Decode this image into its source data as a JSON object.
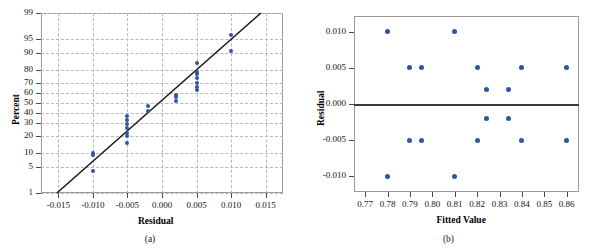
{
  "figure": {
    "panels": [
      {
        "caption": "(a)",
        "chart_data": {
          "type": "scatter",
          "title": "",
          "subtitle": "",
          "xlabel": "Residual",
          "ylabel": "Percent",
          "xlim": [
            -0.0175,
            0.0175
          ],
          "ylim": [
            1,
            99
          ],
          "yscale": "normal-probability",
          "grid": true,
          "legend": "none",
          "xticks": [
            "-0.015",
            "-0.010",
            "-0.005",
            "0.000",
            "0.005",
            "0.010",
            "0.015"
          ],
          "xtickvalues": [
            -0.015,
            -0.01,
            -0.005,
            0.0,
            0.005,
            0.01,
            0.015
          ],
          "yticks": [
            "1",
            "5",
            "10",
            "20",
            "30",
            "40",
            "50",
            "60",
            "70",
            "80",
            "90",
            "95",
            "99"
          ],
          "ytickvalues": [
            1,
            5,
            10,
            20,
            30,
            40,
            50,
            60,
            70,
            80,
            90,
            95,
            99
          ],
          "reference_line": {
            "label": "normal fit line",
            "x": [
              -0.0152,
              0.0143
            ],
            "y": [
              1,
              99
            ]
          },
          "points": [
            {
              "x": -0.01,
              "y": 4
            },
            {
              "x": -0.01,
              "y": 9
            },
            {
              "x": -0.01,
              "y": 10
            },
            {
              "x": -0.005,
              "y": 15
            },
            {
              "x": -0.005,
              "y": 20
            },
            {
              "x": -0.005,
              "y": 22
            },
            {
              "x": -0.005,
              "y": 26
            },
            {
              "x": -0.005,
              "y": 29
            },
            {
              "x": -0.005,
              "y": 33
            },
            {
              "x": -0.005,
              "y": 37
            },
            {
              "x": -0.002,
              "y": 42
            },
            {
              "x": -0.002,
              "y": 47
            },
            {
              "x": 0.002,
              "y": 52
            },
            {
              "x": 0.002,
              "y": 56
            },
            {
              "x": 0.002,
              "y": 58
            },
            {
              "x": 0.005,
              "y": 63
            },
            {
              "x": 0.005,
              "y": 66
            },
            {
              "x": 0.005,
              "y": 70
            },
            {
              "x": 0.005,
              "y": 74
            },
            {
              "x": 0.005,
              "y": 77
            },
            {
              "x": 0.005,
              "y": 79
            },
            {
              "x": 0.005,
              "y": 85
            },
            {
              "x": 0.01,
              "y": 91
            },
            {
              "x": 0.01,
              "y": 96
            }
          ],
          "marker_color": "#2f55a4"
        }
      },
      {
        "caption": "(b)",
        "chart_data": {
          "type": "scatter",
          "title": "",
          "subtitle": "",
          "xlabel": "Fitted Value",
          "ylabel": "Residual",
          "xlim": [
            0.765,
            0.8655
          ],
          "ylim": [
            -0.0122,
            0.0122
          ],
          "grid": false,
          "legend": "none",
          "xticks": [
            "0.77",
            "0.78",
            "0.79",
            "0.80",
            "0.81",
            "0.82",
            "0.83",
            "0.84",
            "0.85",
            "0.86"
          ],
          "xtickvalues": [
            0.77,
            0.78,
            0.79,
            0.8,
            0.81,
            0.82,
            0.83,
            0.84,
            0.85,
            0.86
          ],
          "yticks": [
            "0.010",
            "0.005",
            "0.000",
            "-0.005",
            "-0.010"
          ],
          "ytickvalues": [
            0.01,
            0.005,
            0.0,
            -0.005,
            -0.01
          ],
          "zero_line": {
            "label": "zero residual line",
            "y": 0.0
          },
          "points": [
            {
              "x": 0.78,
              "y": 0.01
            },
            {
              "x": 0.81,
              "y": 0.01
            },
            {
              "x": 0.79,
              "y": 0.005
            },
            {
              "x": 0.795,
              "y": 0.005
            },
            {
              "x": 0.82,
              "y": 0.005
            },
            {
              "x": 0.84,
              "y": 0.005
            },
            {
              "x": 0.86,
              "y": 0.005
            },
            {
              "x": 0.824,
              "y": 0.002
            },
            {
              "x": 0.834,
              "y": 0.002
            },
            {
              "x": 0.824,
              "y": -0.002
            },
            {
              "x": 0.834,
              "y": -0.002
            },
            {
              "x": 0.79,
              "y": -0.005
            },
            {
              "x": 0.795,
              "y": -0.005
            },
            {
              "x": 0.82,
              "y": -0.005
            },
            {
              "x": 0.84,
              "y": -0.005
            },
            {
              "x": 0.86,
              "y": -0.005
            },
            {
              "x": 0.78,
              "y": -0.01
            },
            {
              "x": 0.81,
              "y": -0.01
            }
          ],
          "marker_color": "#2f55a4"
        }
      }
    ]
  }
}
